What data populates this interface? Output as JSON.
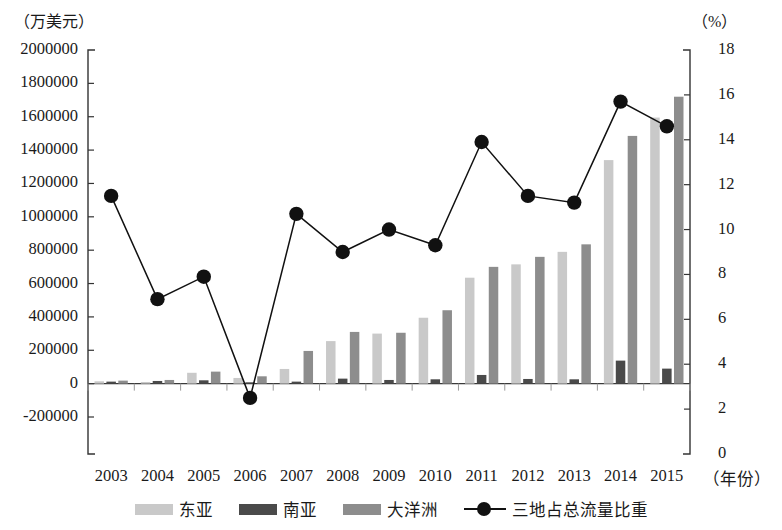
{
  "chart_data": {
    "type": "bar",
    "title": "",
    "subtitle": "",
    "xlabel": "（年份）",
    "ylabel": "（万美元）",
    "y2label": "（%）",
    "grid": false,
    "legend_position": "bottom",
    "categories": [
      "2003",
      "2004",
      "2005",
      "2006",
      "2007",
      "2008",
      "2009",
      "2010",
      "2011",
      "2012",
      "2013",
      "2014",
      "2015"
    ],
    "ylim": [
      -200000,
      2000000
    ],
    "ytick_labels": [
      "2000000",
      "1800000",
      "1600000",
      "1400000",
      "1200000",
      "1000000",
      "800000",
      "600000",
      "400000",
      "200000",
      "0",
      "-200000"
    ],
    "ytick_values": [
      2000000,
      1800000,
      1600000,
      1400000,
      1200000,
      1000000,
      800000,
      600000,
      400000,
      200000,
      0,
      -200000
    ],
    "y2lim": [
      0,
      18
    ],
    "y2tick_labels": [
      "18",
      "16",
      "14",
      "12",
      "10",
      "8",
      "6",
      "4",
      "2",
      "0"
    ],
    "y2tick_values": [
      18,
      16,
      14,
      12,
      10,
      8,
      6,
      4,
      2,
      0
    ],
    "series": [
      {
        "name": "东亚",
        "kind": "bar",
        "axis": "left",
        "color": "#c9c9c9",
        "values": [
          14000,
          10000,
          65000,
          34000,
          88000,
          255000,
          300000,
          395000,
          635000,
          715000,
          790000,
          1340000,
          1595000
        ]
      },
      {
        "name": "南亚",
        "kind": "bar",
        "axis": "left",
        "color": "#4a4a4a",
        "values": [
          12000,
          16000,
          20000,
          8000,
          12000,
          30000,
          22000,
          26000,
          52000,
          28000,
          26000,
          138000,
          90000
        ]
      },
      {
        "name": "大洋洲",
        "kind": "bar",
        "axis": "left",
        "color": "#8d8d8d",
        "values": [
          18000,
          22000,
          72000,
          44000,
          196000,
          310000,
          305000,
          440000,
          700000,
          760000,
          835000,
          1485000,
          1720000
        ]
      },
      {
        "name": "三地占总流量比重",
        "kind": "line",
        "axis": "right",
        "color": "#111111",
        "values": [
          11.5,
          6.9,
          7.9,
          2.5,
          10.7,
          9.0,
          10.0,
          9.3,
          13.9,
          11.5,
          11.2,
          15.7,
          14.6
        ]
      }
    ]
  },
  "legend": {
    "items": [
      {
        "label": "东亚",
        "marker": "swatch"
      },
      {
        "label": "南亚",
        "marker": "swatch"
      },
      {
        "label": "大洋洲",
        "marker": "swatch"
      },
      {
        "label": "三地占总流量比重",
        "marker": "line-dot"
      }
    ]
  }
}
